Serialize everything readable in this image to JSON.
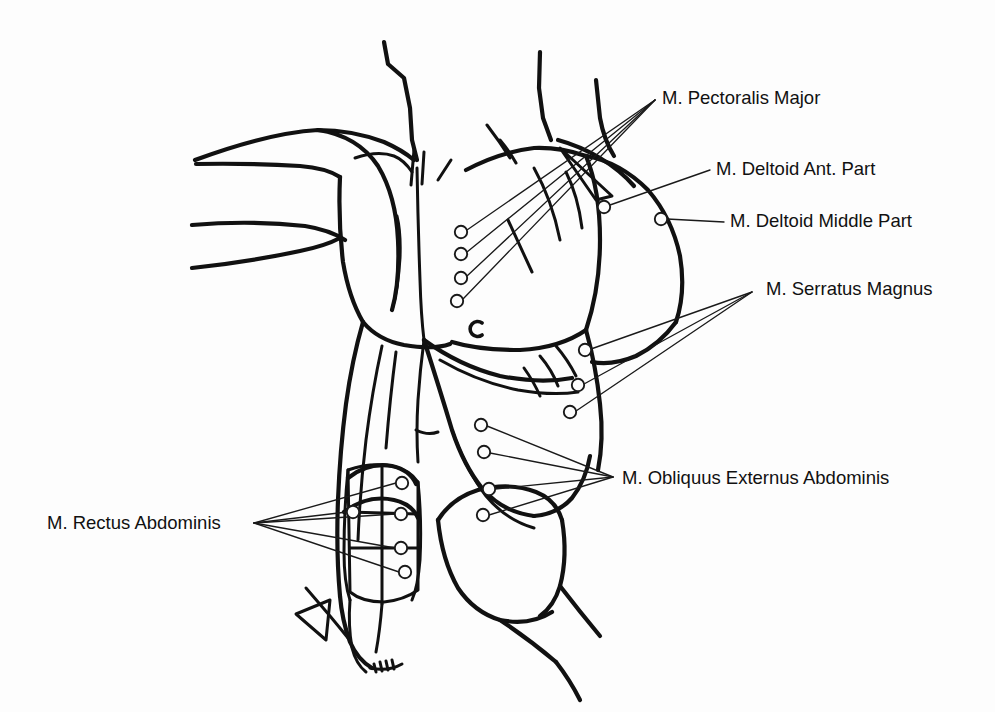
{
  "figure": {
    "title": "Anterior trunk muscle surface electrode placement diagram",
    "background_color": "#fdfdfd",
    "ink_color": "#111111",
    "width": 995,
    "height": 712
  },
  "labels": [
    {
      "id": "pectoralis-major",
      "text": "M. Pectoralis Major",
      "x": 662,
      "y": 104,
      "electrode_count": 4
    },
    {
      "id": "deltoid-anterior-part",
      "text": "M. Deltoid Ant. Part",
      "x": 716,
      "y": 175,
      "electrode_count": 1
    },
    {
      "id": "deltoid-middle-part",
      "text": "M. Deltoid Middle Part",
      "x": 730,
      "y": 227,
      "electrode_count": 1
    },
    {
      "id": "serratus-magnus",
      "text": "M. Serratus Magnus",
      "x": 766,
      "y": 295,
      "electrode_count": 3
    },
    {
      "id": "obliquus-externus-abdominis",
      "text": "M. Obliquus Externus Abdominis",
      "x": 622,
      "y": 484,
      "electrode_count": 4
    },
    {
      "id": "rectus-abdominis",
      "text": "M. Rectus Abdominis",
      "x": 47,
      "y": 529,
      "electrode_count": 5
    }
  ],
  "electrodes": [
    {
      "id": "pectoralis-1",
      "muscle": "pectoralis-major",
      "x": 461,
      "y": 232,
      "r": 6.2
    },
    {
      "id": "pectoralis-2",
      "muscle": "pectoralis-major",
      "x": 461,
      "y": 254,
      "r": 6.2
    },
    {
      "id": "pectoralis-3",
      "muscle": "pectoralis-major",
      "x": 461,
      "y": 278,
      "r": 6.2
    },
    {
      "id": "pectoralis-4",
      "muscle": "pectoralis-major",
      "x": 457,
      "y": 301,
      "r": 6.2
    },
    {
      "id": "deltoid-ant-1",
      "muscle": "deltoid-anterior-part",
      "x": 604,
      "y": 207,
      "r": 6.2
    },
    {
      "id": "deltoid-mid-1",
      "muscle": "deltoid-middle-part",
      "x": 661,
      "y": 219,
      "r": 6.2
    },
    {
      "id": "serratus-1",
      "muscle": "serratus-magnus",
      "x": 585,
      "y": 350,
      "r": 6.2
    },
    {
      "id": "serratus-2",
      "muscle": "serratus-magnus",
      "x": 578,
      "y": 385,
      "r": 6.2
    },
    {
      "id": "serratus-3",
      "muscle": "serratus-magnus",
      "x": 570,
      "y": 412,
      "r": 6.2
    },
    {
      "id": "obliquus-1",
      "muscle": "obliquus-externus-abdominis",
      "x": 481,
      "y": 425,
      "r": 6.2
    },
    {
      "id": "obliquus-2",
      "muscle": "obliquus-externus-abdominis",
      "x": 484,
      "y": 452,
      "r": 6.2
    },
    {
      "id": "obliquus-3",
      "muscle": "obliquus-externus-abdominis",
      "x": 489,
      "y": 489,
      "r": 6.2
    },
    {
      "id": "obliquus-4",
      "muscle": "obliquus-externus-abdominis",
      "x": 483,
      "y": 515,
      "r": 6.2
    },
    {
      "id": "rectus-1",
      "muscle": "rectus-abdominis",
      "x": 402,
      "y": 483,
      "r": 6.2
    },
    {
      "id": "rectus-2",
      "muscle": "rectus-abdominis",
      "x": 353,
      "y": 512,
      "r": 6.2
    },
    {
      "id": "rectus-3",
      "muscle": "rectus-abdominis",
      "x": 401,
      "y": 514,
      "r": 6.2
    },
    {
      "id": "rectus-4",
      "muscle": "rectus-abdominis",
      "x": 401,
      "y": 548,
      "r": 6.2
    },
    {
      "id": "rectus-5",
      "muscle": "rectus-abdominis",
      "x": 405,
      "y": 572,
      "r": 6.2
    }
  ],
  "leader_lines": [
    {
      "id": "leader-pectoralis-1",
      "muscle": "pectoralis-major",
      "from_x": 467,
      "from_y": 230,
      "to_x": 655,
      "to_y": 100
    },
    {
      "id": "leader-pectoralis-2",
      "muscle": "pectoralis-major",
      "from_x": 467,
      "from_y": 252,
      "to_x": 655,
      "to_y": 100
    },
    {
      "id": "leader-pectoralis-3",
      "muscle": "pectoralis-major",
      "from_x": 467,
      "from_y": 276,
      "to_x": 655,
      "to_y": 100
    },
    {
      "id": "leader-pectoralis-4",
      "muscle": "pectoralis-major",
      "from_x": 463,
      "from_y": 299,
      "to_x": 655,
      "to_y": 100
    },
    {
      "id": "leader-deltoid-ant",
      "muscle": "deltoid-anterior-part",
      "from_x": 610,
      "from_y": 205,
      "to_x": 710,
      "to_y": 170
    },
    {
      "id": "leader-deltoid-mid",
      "muscle": "deltoid-middle-part",
      "from_x": 667,
      "from_y": 219,
      "to_x": 724,
      "to_y": 222
    },
    {
      "id": "leader-serratus-1",
      "muscle": "serratus-magnus",
      "from_x": 591,
      "from_y": 349,
      "to_x": 752,
      "to_y": 292
    },
    {
      "id": "leader-serratus-2",
      "muscle": "serratus-magnus",
      "from_x": 584,
      "from_y": 384,
      "to_x": 752,
      "to_y": 292
    },
    {
      "id": "leader-serratus-3",
      "muscle": "serratus-magnus",
      "from_x": 576,
      "from_y": 411,
      "to_x": 752,
      "to_y": 292
    },
    {
      "id": "leader-obliquus-1",
      "muscle": "obliquus-externus-abdominis",
      "from_x": 487,
      "from_y": 426,
      "to_x": 613,
      "to_y": 477
    },
    {
      "id": "leader-obliquus-2",
      "muscle": "obliquus-externus-abdominis",
      "from_x": 490,
      "from_y": 453,
      "to_x": 613,
      "to_y": 477
    },
    {
      "id": "leader-obliquus-3",
      "muscle": "obliquus-externus-abdominis",
      "from_x": 495,
      "from_y": 489,
      "to_x": 613,
      "to_y": 477
    },
    {
      "id": "leader-obliquus-4",
      "muscle": "obliquus-externus-abdominis",
      "from_x": 489,
      "from_y": 515,
      "to_x": 613,
      "to_y": 477
    },
    {
      "id": "leader-rectus-1",
      "muscle": "rectus-abdominis",
      "from_x": 396,
      "from_y": 483,
      "to_x": 254,
      "to_y": 523
    },
    {
      "id": "leader-rectus-2",
      "muscle": "rectus-abdominis",
      "from_x": 347,
      "from_y": 512,
      "to_x": 254,
      "to_y": 523
    },
    {
      "id": "leader-rectus-3",
      "muscle": "rectus-abdominis",
      "from_x": 395,
      "from_y": 514,
      "to_x": 254,
      "to_y": 523
    },
    {
      "id": "leader-rectus-4",
      "muscle": "rectus-abdominis",
      "from_x": 395,
      "from_y": 548,
      "to_x": 254,
      "to_y": 523
    },
    {
      "id": "leader-rectus-5",
      "muscle": "rectus-abdominis",
      "from_x": 399,
      "from_y": 572,
      "to_x": 254,
      "to_y": 523
    }
  ],
  "anatomy_paths": [
    {
      "id": "neck-left-edge",
      "d": "M 384 42 L 388 64 L 404 78 L 410 108 L 412 140 L 417 160",
      "weight": "normal"
    },
    {
      "id": "neck-right-edge",
      "d": "M 540 52 L 539 88 L 543 118 L 551 140",
      "weight": "normal"
    },
    {
      "id": "clavicle-left",
      "d": "M 195 160 Q 268 133 318 130 Q 352 130 384 142 Q 402 150 414 160",
      "weight": "normal"
    },
    {
      "id": "clavicle-right",
      "d": "M 466 170 Q 500 152 534 148 Q 560 147 586 156",
      "weight": "normal"
    },
    {
      "id": "sternal-notch-dip",
      "d": "M 355 158 Q 378 150 394 156 Q 404 160 412 172",
      "weight": "thin"
    },
    {
      "id": "neck-tendon-left",
      "d": "M 414 150 L 411 185",
      "weight": "thin"
    },
    {
      "id": "neck-tendon-right",
      "d": "M 424 152 L 422 184",
      "weight": "thin"
    },
    {
      "id": "neck-fold-right",
      "d": "M 451 160 L 438 180",
      "weight": "thin"
    },
    {
      "id": "trapezius-right",
      "d": "M 487 125 Q 500 142 510 158",
      "weight": "thin"
    },
    {
      "id": "trapezius-right-2",
      "d": "M 500 140 Q 510 152 516 163",
      "weight": "thin"
    },
    {
      "id": "arm-left-upper-contour",
      "d": "M 196 164 Q 250 163 300 166 Q 326 168 340 177",
      "weight": "normal"
    },
    {
      "id": "arm-left-mid-contour",
      "d": "M 192 225 Q 250 220 305 226 Q 330 230 345 240",
      "weight": "normal"
    },
    {
      "id": "arm-left-lower-contour",
      "d": "M 192 268 Q 248 262 300 251 Q 325 246 340 238",
      "weight": "normal"
    },
    {
      "id": "shoulder-left-deltoid",
      "d": "M 318 130 Q 358 136 378 166 Q 396 196 398 240 Q 400 282 392 310",
      "weight": "normal"
    },
    {
      "id": "pec-left-lateral",
      "d": "M 340 177 Q 338 220 343 262 Q 349 298 363 322",
      "weight": "normal"
    },
    {
      "id": "pec-left-lower",
      "d": "M 363 322 Q 378 340 404 345 Q 434 350 450 344",
      "weight": "normal"
    },
    {
      "id": "pec-left-inner-fold",
      "d": "M 392 310 Q 398 290 400 258 Q 401 232 397 216",
      "weight": "thin"
    },
    {
      "id": "sternum-midline",
      "d": "M 417 168 Q 418 225 420 280 Q 421 315 424 340",
      "weight": "thin"
    },
    {
      "id": "pec-right-lateral",
      "d": "M 586 156 Q 600 190 600 240 Q 600 288 586 330",
      "weight": "normal"
    },
    {
      "id": "pec-right-lower",
      "d": "M 586 330 Q 560 348 520 350 Q 478 350 452 342",
      "weight": "normal"
    },
    {
      "id": "pec-right-upper-fold",
      "d": "M 534 168 Q 552 200 560 240",
      "weight": "thin"
    },
    {
      "id": "pec-right-inner-fold",
      "d": "M 508 220 Q 520 246 532 272",
      "weight": "thin"
    },
    {
      "id": "armpit-right-crease",
      "d": "M 566 172 Q 578 196 582 228",
      "weight": "thin"
    },
    {
      "id": "deltoid-right-outline",
      "d": "M 586 156 Q 620 162 648 190 Q 672 218 680 256 Q 686 292 676 322",
      "weight": "normal"
    },
    {
      "id": "deltoid-right-inner",
      "d": "M 676 322 Q 660 344 636 356 Q 612 366 592 362",
      "weight": "normal"
    },
    {
      "id": "arm-right-upper",
      "d": "M 596 80 L 600 118 Q 604 140 614 156",
      "weight": "normal"
    },
    {
      "id": "arm-right-inner",
      "d": "M 558 140 Q 580 146 600 158 Q 620 170 634 186",
      "weight": "normal"
    },
    {
      "id": "arm-right-wedge",
      "d": "M 560 148 L 612 196 L 596 200 Z",
      "weight": "thin"
    },
    {
      "id": "torso-left-edge",
      "d": "M 363 322 Q 352 360 346 404 Q 340 450 338 500 Q 336 552 340 596",
      "weight": "normal"
    },
    {
      "id": "torso-left-edge-lower",
      "d": "M 340 596 Q 342 620 350 642 Q 358 660 372 668",
      "weight": "normal"
    },
    {
      "id": "flank-left-inner",
      "d": "M 382 346 Q 372 392 366 440 Q 360 490 358 540",
      "weight": "thin"
    },
    {
      "id": "flank-left-inner-2",
      "d": "M 396 352 Q 390 398 386 448",
      "weight": "thin"
    },
    {
      "id": "serratus-arc-1",
      "d": "M 424 340 Q 460 366 500 376 Q 540 384 572 378",
      "weight": "normal"
    },
    {
      "id": "serratus-arc-2",
      "d": "M 440 360 Q 478 382 518 390 Q 552 396 578 392",
      "weight": "thin"
    },
    {
      "id": "serratus-digit-1",
      "d": "M 540 356 Q 552 370 558 386",
      "weight": "thin"
    },
    {
      "id": "serratus-digit-2",
      "d": "M 556 346 Q 568 360 576 376",
      "weight": "thin"
    },
    {
      "id": "serratus-digit-3",
      "d": "M 524 368 Q 534 382 540 396",
      "weight": "thin"
    },
    {
      "id": "rib-cage-right",
      "d": "M 586 330 Q 596 366 600 404 Q 604 440 598 470",
      "weight": "normal"
    },
    {
      "id": "obliquus-body",
      "d": "M 424 340 Q 440 390 452 430 Q 464 466 482 488 Q 502 512 534 516",
      "weight": "normal"
    },
    {
      "id": "obliquus-lateral",
      "d": "M 534 516 Q 558 514 572 498 Q 586 480 590 456",
      "weight": "normal"
    },
    {
      "id": "obliquus-lower-mass",
      "d": "M 452 430 Q 466 470 486 496 Q 506 520 534 528",
      "weight": "thin"
    },
    {
      "id": "hip-flank-outline",
      "d": "M 438 520 Q 442 560 458 588 Q 474 612 500 620 Q 530 626 552 612",
      "weight": "normal"
    },
    {
      "id": "hip-flank-top",
      "d": "M 438 520 Q 452 498 478 490 Q 510 482 536 492 Q 556 500 562 520",
      "weight": "normal"
    },
    {
      "id": "hip-flank-right",
      "d": "M 562 520 Q 568 556 560 586 Q 554 606 540 616",
      "weight": "normal"
    },
    {
      "id": "inguinal-line",
      "d": "M 500 620 Q 530 640 556 662",
      "weight": "normal"
    },
    {
      "id": "groin-line-right",
      "d": "M 560 586 Q 580 612 600 636",
      "weight": "normal"
    },
    {
      "id": "rectus-block-outline",
      "d": "M 348 470 Q 370 462 392 466 Q 410 470 418 482 L 418 590 Q 404 600 384 602 Q 362 602 350 592 Z",
      "weight": "thin"
    },
    {
      "id": "rectus-arch-1",
      "d": "M 348 478 Q 368 462 392 466 Q 410 470 416 484",
      "weight": "normal"
    },
    {
      "id": "rectus-arch-2",
      "d": "M 344 512 Q 368 494 394 500 Q 412 504 418 518",
      "weight": "normal"
    },
    {
      "id": "rectus-midline",
      "d": "M 382 466 L 382 604",
      "weight": "thin"
    },
    {
      "id": "rectus-tendon-1",
      "d": "M 348 512 L 418 514",
      "weight": "thin"
    },
    {
      "id": "rectus-tendon-2",
      "d": "M 350 548 L 418 548",
      "weight": "thin"
    },
    {
      "id": "rectus-lateral-right",
      "d": "M 418 482 Q 422 520 420 560 Q 418 586 412 600",
      "weight": "thin"
    },
    {
      "id": "rectus-lateral-left",
      "d": "M 348 470 Q 344 510 344 552 Q 344 582 350 600",
      "weight": "thin"
    },
    {
      "id": "linea-alba-lower",
      "d": "M 382 604 Q 380 630 376 652",
      "weight": "thin"
    },
    {
      "id": "abdomen-lower-left",
      "d": "M 350 600 Q 348 626 352 648 Q 356 664 366 672",
      "weight": "thin"
    },
    {
      "id": "iliac-crest-left",
      "d": "M 306 588 Q 318 602 330 616 Q 340 628 348 638",
      "weight": "thin"
    },
    {
      "id": "iliac-wedge-left",
      "d": "M 296 614 L 330 600 L 326 640 Z",
      "weight": "thin"
    },
    {
      "id": "pubic-line",
      "d": "M 370 668 Q 388 672 402 664",
      "weight": "thin"
    },
    {
      "id": "pubic-hatch",
      "d": "M 374 664 L 376 672 M 380 662 L 382 671 M 386 661 L 388 670 M 392 660 L 394 669",
      "weight": "thin"
    },
    {
      "id": "thigh-right-edge",
      "d": "M 556 662 Q 570 680 580 700",
      "weight": "normal"
    },
    {
      "id": "abdomen-center-fold",
      "d": "M 424 340 Q 420 370 418 400 Q 416 432 418 462",
      "weight": "thin"
    },
    {
      "id": "umbilicus-region",
      "d": "M 416 430 Q 428 436 438 432",
      "weight": "thin"
    }
  ],
  "nipple_mark": {
    "id": "nipple-mark",
    "x": 478,
    "y": 329,
    "r": 7.5
  }
}
